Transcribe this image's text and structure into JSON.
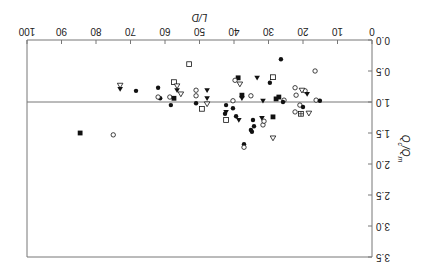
{
  "chart_data": {
    "type": "scatter",
    "title": "",
    "orientation_note": "figure displayed rotated 180 degrees",
    "xlabel": "L/D",
    "ylabel": "Qc/Qm",
    "xlim": [
      0,
      100
    ],
    "ylim": [
      3.5,
      0.0
    ],
    "x_ticks": [
      "0",
      "10",
      "20",
      "30",
      "40",
      "50",
      "60",
      "70",
      "80",
      "90",
      "100"
    ],
    "y_ticks": [
      "0.0",
      "0.5",
      "1.0",
      "1.5",
      "2.0",
      "2.5",
      "3.0",
      "3.5"
    ],
    "reference_line": {
      "y": 1.0
    },
    "grid": false,
    "legend": null,
    "marker_types": [
      "filled-circle",
      "open-circle",
      "filled-square",
      "open-square",
      "filled-triangle-down",
      "open-triangle-down",
      "open-square-plus"
    ],
    "points": [
      {
        "x": 84.6,
        "y": 1.5,
        "m": "filled-square"
      },
      {
        "x": 75.0,
        "y": 1.53,
        "m": "open-circle"
      },
      {
        "x": 73.0,
        "y": 0.73,
        "m": "open-triangle-down"
      },
      {
        "x": 73.0,
        "y": 0.79,
        "m": "filled-triangle-down"
      },
      {
        "x": 68.4,
        "y": 0.82,
        "m": "filled-circle"
      },
      {
        "x": 62.0,
        "y": 0.77,
        "m": "filled-circle"
      },
      {
        "x": 61.4,
        "y": 0.94,
        "m": "filled-circle"
      },
      {
        "x": 62.0,
        "y": 0.92,
        "m": "open-circle"
      },
      {
        "x": 57.4,
        "y": 0.68,
        "m": "open-square"
      },
      {
        "x": 56.5,
        "y": 0.74,
        "m": "open-triangle-down"
      },
      {
        "x": 56.5,
        "y": 0.81,
        "m": "filled-triangle-down"
      },
      {
        "x": 55.4,
        "y": 0.87,
        "m": "open-triangle-down"
      },
      {
        "x": 58.6,
        "y": 0.92,
        "m": "open-circle"
      },
      {
        "x": 57.4,
        "y": 0.94,
        "m": "filled-square"
      },
      {
        "x": 58.3,
        "y": 1.05,
        "m": "filled-circle"
      },
      {
        "x": 53.0,
        "y": 0.39,
        "m": "open-square"
      },
      {
        "x": 51.0,
        "y": 0.81,
        "m": "open-circle"
      },
      {
        "x": 51.0,
        "y": 0.9,
        "m": "open-circle"
      },
      {
        "x": 47.8,
        "y": 0.81,
        "m": "filled-triangle-down"
      },
      {
        "x": 47.8,
        "y": 0.94,
        "m": "filled-triangle-down"
      },
      {
        "x": 47.8,
        "y": 1.03,
        "m": "open-triangle-down"
      },
      {
        "x": 51.0,
        "y": 1.02,
        "m": "filled-circle"
      },
      {
        "x": 49.3,
        "y": 1.11,
        "m": "open-square"
      },
      {
        "x": 42.3,
        "y": 1.05,
        "m": "filled-circle"
      },
      {
        "x": 42.3,
        "y": 1.16,
        "m": "filled-triangle-down"
      },
      {
        "x": 40.3,
        "y": 1.1,
        "m": "filled-circle"
      },
      {
        "x": 42.3,
        "y": 1.29,
        "m": "open-square"
      },
      {
        "x": 38.6,
        "y": 1.29,
        "m": "filled-triangle-down"
      },
      {
        "x": 38.8,
        "y": 0.61,
        "m": "filled-square"
      },
      {
        "x": 39.7,
        "y": 0.65,
        "m": "open-circle"
      },
      {
        "x": 38.3,
        "y": 0.71,
        "m": "open-triangle-down"
      },
      {
        "x": 33.3,
        "y": 0.61,
        "m": "filled-triangle-down"
      },
      {
        "x": 29.6,
        "y": 0.69,
        "m": "filled-circle"
      },
      {
        "x": 28.7,
        "y": 0.6,
        "m": "open-square"
      },
      {
        "x": 26.4,
        "y": 0.31,
        "m": "filled-circle"
      },
      {
        "x": 16.5,
        "y": 0.5,
        "m": "open-circle"
      },
      {
        "x": 37.7,
        "y": 0.89,
        "m": "filled-square"
      },
      {
        "x": 37.7,
        "y": 0.94,
        "m": "filled-triangle-down"
      },
      {
        "x": 35.1,
        "y": 0.9,
        "m": "open-circle"
      },
      {
        "x": 31.6,
        "y": 0.98,
        "m": "filled-triangle-down"
      },
      {
        "x": 27.0,
        "y": 0.92,
        "m": "filled-square"
      },
      {
        "x": 27.8,
        "y": 0.95,
        "m": "filled-square"
      },
      {
        "x": 25.5,
        "y": 0.97,
        "m": "open-circle"
      },
      {
        "x": 40.3,
        "y": 0.98,
        "m": "open-circle"
      },
      {
        "x": 42.6,
        "y": 1.19,
        "m": "filled-circle"
      },
      {
        "x": 39.4,
        "y": 1.23,
        "m": "filled-circle"
      },
      {
        "x": 34.5,
        "y": 1.29,
        "m": "filled-circle"
      },
      {
        "x": 34.2,
        "y": 1.39,
        "m": "filled-circle"
      },
      {
        "x": 31.6,
        "y": 1.37,
        "m": "open-circle"
      },
      {
        "x": 31.9,
        "y": 1.26,
        "m": "filled-triangle-down"
      },
      {
        "x": 31.3,
        "y": 1.31,
        "m": "open-circle"
      },
      {
        "x": 34.8,
        "y": 1.48,
        "m": "filled-circle"
      },
      {
        "x": 35.1,
        "y": 1.45,
        "m": "filled-circle"
      },
      {
        "x": 28.7,
        "y": 1.24,
        "m": "filled-square"
      },
      {
        "x": 37.1,
        "y": 1.68,
        "m": "filled-circle"
      },
      {
        "x": 37.1,
        "y": 1.73,
        "m": "open-circle"
      },
      {
        "x": 28.7,
        "y": 1.58,
        "m": "open-triangle-down"
      },
      {
        "x": 22.3,
        "y": 0.77,
        "m": "open-circle"
      },
      {
        "x": 22.0,
        "y": 0.89,
        "m": "open-circle"
      },
      {
        "x": 19.4,
        "y": 0.82,
        "m": "open-circle"
      },
      {
        "x": 18.8,
        "y": 0.87,
        "m": "filled-triangle-down"
      },
      {
        "x": 20.3,
        "y": 0.81,
        "m": "open-triangle-down"
      },
      {
        "x": 20.9,
        "y": 1.05,
        "m": "open-circle"
      },
      {
        "x": 20.0,
        "y": 1.08,
        "m": "filled-circle"
      },
      {
        "x": 18.3,
        "y": 1.18,
        "m": "open-triangle-down"
      },
      {
        "x": 22.3,
        "y": 1.16,
        "m": "open-circle"
      },
      {
        "x": 20.6,
        "y": 1.19,
        "m": "open-square-plus"
      },
      {
        "x": 16.2,
        "y": 0.97,
        "m": "open-circle"
      },
      {
        "x": 15.1,
        "y": 0.98,
        "m": "filled-circle"
      },
      {
        "x": 25.8,
        "y": 1.0,
        "m": "filled-circle"
      }
    ]
  },
  "axes": {
    "x_title": "L/D",
    "y_title_main": "Q",
    "y_title_sub1": "c",
    "y_title_sep": "/Q",
    "y_title_sub2": "m"
  },
  "colors": {
    "axis": "#777777",
    "marker": "#111111",
    "text": "#222222"
  }
}
